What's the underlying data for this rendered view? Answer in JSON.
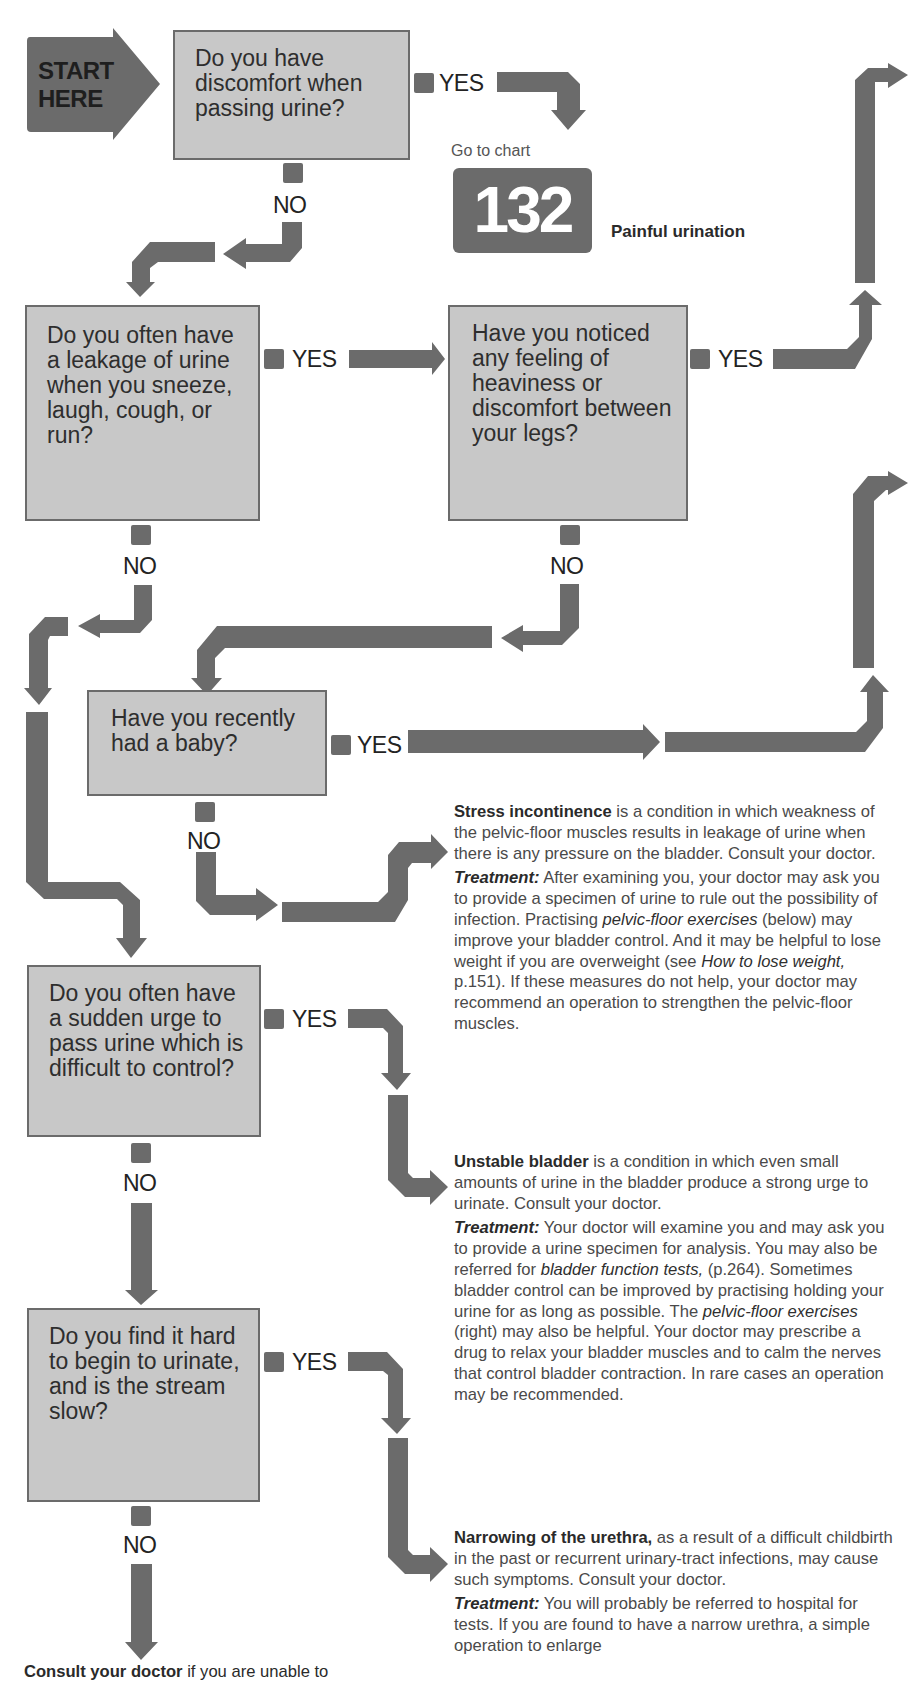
{
  "start": {
    "line1": "START",
    "line2": "HERE"
  },
  "questions": [
    {
      "id": "q1",
      "text": "Do you have discomfort when passing urine?",
      "yes": "YES",
      "no": "NO"
    },
    {
      "id": "q2",
      "text": "Do you often have a leakage of urine when you sneeze, laugh, cough, or run?",
      "yes": "YES",
      "no": "NO"
    },
    {
      "id": "q3",
      "text": "Have you noticed any feeling of heaviness or discomfort between your legs?",
      "yes": "YES",
      "no": "NO"
    },
    {
      "id": "q4",
      "text": "Have you recently had a baby?",
      "yes": "YES",
      "no": "NO"
    },
    {
      "id": "q5",
      "text": "Do you often have a sudden urge to pass urine which is difficult to control?",
      "yes": "YES",
      "no": "NO"
    },
    {
      "id": "q6",
      "text": "Do you find it hard to begin to urinate, and is the stream slow?",
      "yes": "YES",
      "no": "NO"
    }
  ],
  "goto_chart": {
    "prefix": "Go to chart",
    "number": "132",
    "title": "Painful urination"
  },
  "diagnoses": [
    {
      "title": "Stress incontinence",
      "desc": " is a condition in which weakness of the pelvic-floor muscles results in leakage of urine when there is any pressure on the bladder. Consult your doctor.",
      "treatment_label": "Treatment:",
      "treatment_parts": [
        " After examining you, your doctor may ask you to provide a specimen of urine to rule out the possibility of infection. Practising ",
        "pelvic-floor exercises",
        " (below) may improve your bladder control. And it may be helpful to lose weight if you are overweight (see ",
        "How to lose weight,",
        " p.151). If these measures do not help, your doctor may recommend an operation to strengthen the pelvic-floor muscles."
      ]
    },
    {
      "title": "Unstable bladder",
      "desc": " is a condition in which even small amounts of urine in the bladder produce a strong urge to urinate. Consult your doctor.",
      "treatment_label": "Treatment:",
      "treatment_parts": [
        " Your doctor will examine you and may ask you to provide a urine specimen for analysis. You may also be referred for ",
        "bladder function tests,",
        " (p.264). Sometimes bladder control can be improved by practising holding your urine for as long as possible. The ",
        "pelvic-floor exercises",
        " (right) may also be helpful. Your doctor may prescribe a drug to relax your bladder muscles and to calm the nerves that control bladder contraction. In rare cases an operation may be recommended."
      ]
    },
    {
      "title": "Narrowing of the urethra,",
      "desc": " as a result of a difficult childbirth in the past or recurrent urinary-tract infections, may cause such symptoms. Consult your doctor.",
      "treatment_label": "Treatment:",
      "treatment_parts": [
        " You will probably be referred to hospital for tests. If you are found to have a narrow urethra, a simple operation to enlarge"
      ]
    }
  ],
  "footer": {
    "bold": "Consult your doctor",
    "rest": " if you are unable to"
  },
  "colors": {
    "arrow": "#6b6b6b",
    "box_fill": "#c8c8c8",
    "box_border": "#6b6b6b",
    "background": "#ffffff"
  }
}
